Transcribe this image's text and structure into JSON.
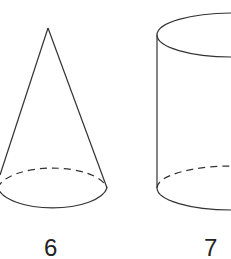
{
  "figures": [
    {
      "shape": "cone",
      "label": "6"
    },
    {
      "shape": "cylinder",
      "label": "7"
    }
  ],
  "colors": {
    "stroke": "#333333",
    "background": "#ffffff"
  }
}
